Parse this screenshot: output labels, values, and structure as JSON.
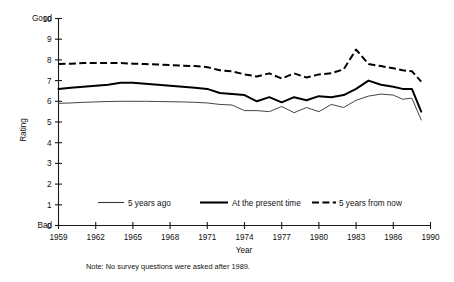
{
  "chart_data": {
    "type": "line",
    "title": "",
    "xlabel": "Year",
    "ylabel": "Rating",
    "xlim": [
      1959,
      1990
    ],
    "ylim": [
      0,
      10
    ],
    "grid": false,
    "legend_position": "inside-bottom",
    "y_top_annotation": "Good",
    "y_bottom_annotation": "Bad",
    "xticks": [
      1959,
      1962,
      1965,
      1968,
      1971,
      1974,
      1977,
      1980,
      1983,
      1986,
      1990
    ],
    "xtick_labels": [
      "1959",
      "1962",
      "1965",
      "1968",
      "1971",
      "1974",
      "1977",
      "1980",
      "1983",
      "1986",
      "1990"
    ],
    "yticks": [
      0,
      1,
      2,
      3,
      4,
      5,
      6,
      7,
      8,
      9,
      10
    ],
    "ytick_labels": [
      "0",
      "1",
      "2",
      "3",
      "4",
      "5",
      "6",
      "7",
      "8",
      "9",
      "10"
    ],
    "annotation": "Note: No survey questions were asked after 1989.",
    "x": [
      1959,
      1960,
      1961,
      1962,
      1963,
      1964,
      1965,
      1966,
      1967,
      1968,
      1969,
      1970,
      1971,
      1972,
      1973,
      1974,
      1975,
      1976,
      1977,
      1978,
      1979,
      1980,
      1981,
      1982,
      1983,
      1984,
      1985,
      1986,
      1987,
      1988,
      1989
    ],
    "series": [
      {
        "name": "5 years ago",
        "style": "thin-solid",
        "values": [
          5.9,
          5.92,
          5.95,
          5.97,
          5.99,
          6.0,
          6.0,
          6.0,
          5.99,
          5.98,
          5.97,
          5.95,
          5.92,
          5.85,
          5.82,
          5.55,
          5.55,
          5.5,
          5.75,
          5.45,
          5.7,
          5.5,
          5.85,
          5.7,
          6.05,
          6.25,
          6.35,
          6.3,
          6.1,
          6.15,
          5.1
        ]
      },
      {
        "name": "At the present time",
        "style": "thick-solid",
        "values": [
          6.6,
          6.65,
          6.7,
          6.75,
          6.8,
          6.9,
          6.9,
          6.85,
          6.8,
          6.75,
          6.7,
          6.65,
          6.6,
          6.4,
          6.35,
          6.3,
          6.0,
          6.2,
          5.95,
          6.2,
          6.05,
          6.25,
          6.2,
          6.3,
          6.6,
          7.0,
          6.8,
          6.7,
          6.6,
          6.6,
          5.5
        ]
      },
      {
        "name": "5 years from now",
        "style": "dashed",
        "values": [
          7.8,
          7.82,
          7.85,
          7.85,
          7.85,
          7.85,
          7.82,
          7.8,
          7.78,
          7.75,
          7.72,
          7.7,
          7.65,
          7.5,
          7.45,
          7.3,
          7.2,
          7.35,
          7.1,
          7.35,
          7.15,
          7.3,
          7.35,
          7.55,
          8.5,
          7.8,
          7.7,
          7.6,
          7.5,
          7.45,
          6.95
        ]
      }
    ]
  },
  "legend": {
    "items": [
      {
        "label": "5 years ago"
      },
      {
        "label": "At the present time"
      },
      {
        "label": "5 years from now"
      }
    ]
  }
}
